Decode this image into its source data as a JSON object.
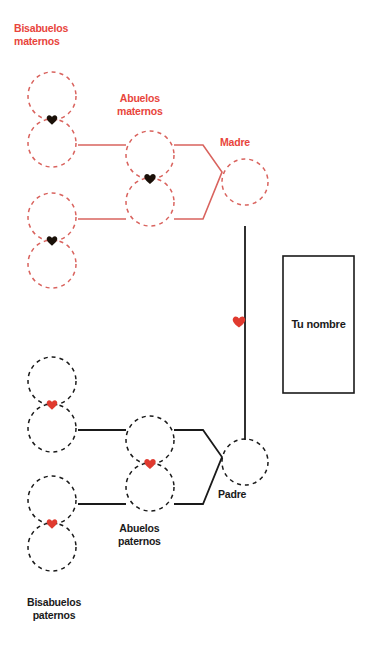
{
  "meta": {
    "width": 373,
    "height": 648
  },
  "colors": {
    "maternal_red": "#d9635e",
    "label_red": "#e8453c",
    "paternal_black": "#1a1a1a",
    "heart_dark": "#1a1008",
    "heart_red": "#e03a2f",
    "background": "#ffffff"
  },
  "labels": {
    "bisabuelos_maternos": "Bisabuelos\nmaternos",
    "abuelos_maternos": "Abuelos\nmaternos",
    "madre": "Madre",
    "tu_nombre": "Tu nombre",
    "padre": "Padre",
    "abuelos_paternos": "Abuelos\npaternos",
    "bisabuelos_paternos": "Bisabuelos\npaternos"
  },
  "maternal_branch": {
    "side": "maternal",
    "stroke": "#d9635e",
    "heart_color": "#1a1008",
    "great_grandparent_pairs": [
      {
        "name": "great-grandparents-maternal-upper",
        "cx": 52,
        "cy_top": 96,
        "cy_bottom": 143,
        "r": 24,
        "heart_x": 52,
        "heart_y": 120
      },
      {
        "name": "great-grandparents-maternal-lower",
        "cx": 52,
        "cy_top": 217,
        "cy_bottom": 264,
        "r": 24,
        "heart_x": 52,
        "heart_y": 241
      }
    ],
    "grandparent_pair": {
      "name": "grandparents-maternal",
      "cx": 150,
      "cy_top": 155,
      "cy_bottom": 202,
      "r": 24,
      "heart_x": 150,
      "heart_y": 179
    },
    "parent": {
      "name": "mother",
      "cx": 245,
      "cy": 182,
      "r": 23
    }
  },
  "paternal_branch": {
    "side": "paternal",
    "stroke": "#1a1a1a",
    "heart_color": "#e03a2f",
    "great_grandparent_pairs": [
      {
        "name": "great-grandparents-paternal-upper",
        "cx": 52,
        "cy_top": 381,
        "cy_bottom": 428,
        "r": 24,
        "heart_x": 52,
        "heart_y": 405
      },
      {
        "name": "great-grandparents-paternal-lower",
        "cx": 52,
        "cy_top": 500,
        "cy_bottom": 547,
        "r": 24,
        "heart_x": 52,
        "heart_y": 524
      }
    ],
    "grandparent_pair": {
      "name": "grandparents-paternal",
      "cx": 150,
      "cy_top": 440,
      "cy_bottom": 487,
      "r": 24,
      "heart_x": 150,
      "heart_y": 464
    },
    "parent": {
      "name": "father",
      "cx": 245,
      "cy": 462,
      "r": 23
    }
  },
  "center": {
    "name_box": {
      "x": 283,
      "y": 256,
      "width": 71,
      "height": 137,
      "stroke": "#1a1a1a"
    },
    "union_line": {
      "x": 245,
      "y_top": 226,
      "y_bottom": 440,
      "stroke": "#1a1a1a"
    },
    "union_heart": {
      "x": 238,
      "y": 322,
      "color": "#e03a2f"
    }
  },
  "connectors": {
    "maternal": {
      "upper_spouse_line": {
        "x1": 78,
        "y1": 145,
        "x2": 126,
        "y2": 145
      },
      "lower_spouse_line": {
        "x1": 78,
        "y1": 219,
        "x2": 126,
        "y2": 219
      },
      "bracket": "M174,145 L203,145 L222,172 L203,219 L174,219"
    },
    "paternal": {
      "upper_spouse_line": {
        "x1": 78,
        "y1": 430,
        "x2": 126,
        "y2": 430
      },
      "lower_spouse_line": {
        "x1": 78,
        "y1": 504,
        "x2": 126,
        "y2": 504
      },
      "bracket": "M174,430 L203,430 L222,457 L203,504 L174,504"
    }
  }
}
